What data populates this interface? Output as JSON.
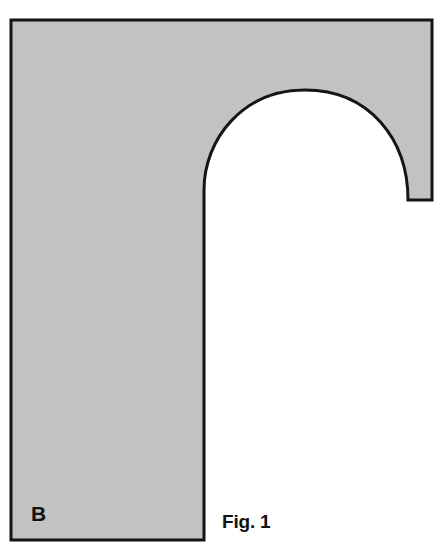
{
  "figure": {
    "caption": "Fig. 1",
    "region_label": "B",
    "colors": {
      "fill": "#c2c2c2",
      "stroke": "#151515",
      "background": "#ffffff",
      "text": "#111111"
    },
    "stroke_width": 3,
    "shape": {
      "type": "arched-hook-cross-section",
      "description": "Hook shaped hatched solid formed by a rectangle with a large semicircular arch cut from its lower middle-right",
      "outer_rect": {
        "left": 11,
        "top": 20,
        "right": 432,
        "bottom": 540
      },
      "leg_right_edge_x": 204,
      "arch_apex": {
        "x": 305,
        "y": 90
      },
      "arch_left_springing": {
        "x": 204,
        "y": 190
      },
      "arch_right_corner": {
        "x": 408,
        "y": 200
      },
      "path": "M 11 20 L 432 20 L 432 200 L 408 200 C 408 140 370 90 305 90 C 243 90 204 139 204 190 L 204 540 L 11 540 Z"
    }
  }
}
